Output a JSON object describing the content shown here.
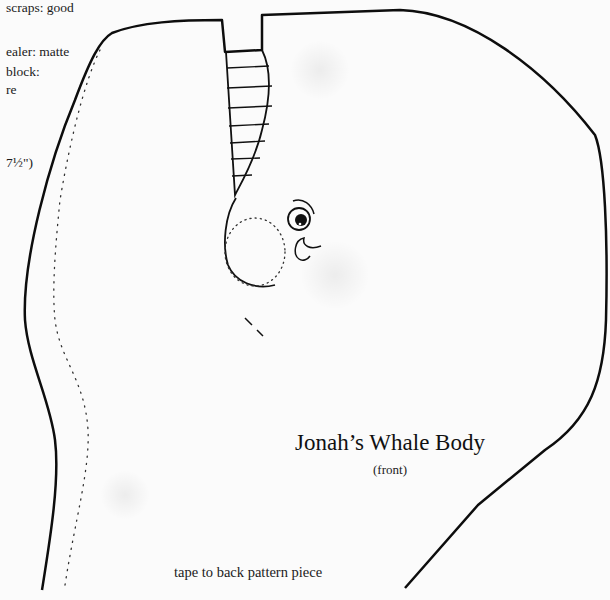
{
  "left_notes": [
    {
      "text": "scraps: good",
      "top": 0,
      "left": 6
    },
    {
      "text": "ealer: matte",
      "top": 44,
      "left": 6
    },
    {
      "text": " block:",
      "top": 64,
      "left": 6
    },
    {
      "text": "re",
      "top": 82,
      "left": 6
    },
    {
      "text": "7½\")",
      "top": 155,
      "left": 6
    }
  ],
  "pattern": {
    "title": "Jonah’s Whale Body",
    "subtitle": "(front)",
    "instruction": "tape to back pattern piece"
  },
  "colors": {
    "line": "#0d0d0d",
    "paper": "#fbfbfb"
  }
}
